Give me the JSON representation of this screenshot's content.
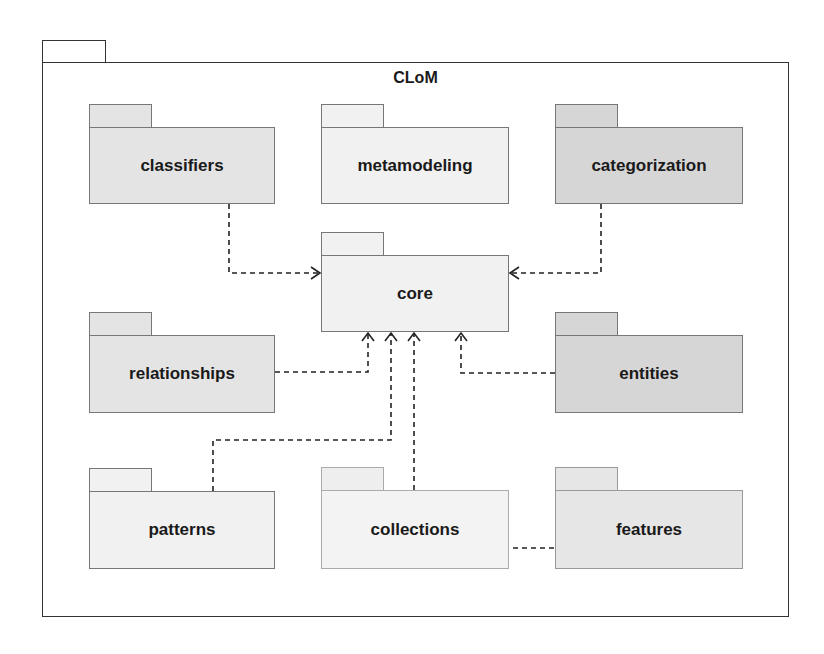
{
  "diagram": {
    "type": "UML package diagram",
    "frame": {
      "title": "CLoM"
    },
    "colors": {
      "line": "#333333",
      "fill_light": "#f1f1f1",
      "fill_mid": "#e4e4e4",
      "fill_dark": "#d6d6d6"
    },
    "packages": {
      "classifiers": {
        "label": "classifiers"
      },
      "metamodeling": {
        "label": "metamodeling"
      },
      "categorization": {
        "label": "categorization"
      },
      "core": {
        "label": "core"
      },
      "relationships": {
        "label": "relationships"
      },
      "entities": {
        "label": "entities"
      },
      "patterns": {
        "label": "patterns"
      },
      "collections": {
        "label": "collections"
      },
      "features": {
        "label": "features"
      }
    },
    "dependencies": [
      {
        "from": "classifiers",
        "to": "core",
        "style": "dashed-open-arrow"
      },
      {
        "from": "categorization",
        "to": "core",
        "style": "dashed-open-arrow"
      },
      {
        "from": "relationships",
        "to": "core",
        "style": "dashed-open-arrow"
      },
      {
        "from": "patterns",
        "to": "core",
        "style": "dashed-open-arrow"
      },
      {
        "from": "collections",
        "to": "core",
        "style": "dashed-open-arrow"
      },
      {
        "from": "entities",
        "to": "core",
        "style": "dashed-open-arrow"
      },
      {
        "from": "features",
        "to": "collections",
        "style": "dashed-line"
      }
    ]
  }
}
